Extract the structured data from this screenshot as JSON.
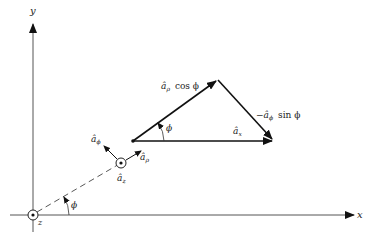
{
  "figure": {
    "type": "vector-decomposition-diagram",
    "axes": {
      "x_label": "x",
      "y_label": "y",
      "z_label": "z",
      "origin_symbol": "dot-in-circle (z-axis out of page)"
    },
    "angle_label": "ϕ",
    "point": {
      "unit_vectors": {
        "a_rho": "âρ",
        "a_phi": "âϕ",
        "a_z": "âz"
      }
    },
    "triangle": {
      "side_rho": "âρ cos ϕ",
      "side_phi": "−âϕ sin ϕ",
      "side_x": "âx",
      "angle": "ϕ"
    },
    "colors": {
      "line": "#111111",
      "axis": "#555555",
      "text": "#222222"
    }
  },
  "labels": {
    "x": "x",
    "y": "y",
    "z": "z",
    "phi": "ϕ",
    "a_hat": "â",
    "rho_sub": "ρ",
    "phi_sub": "ϕ",
    "z_sub": "z",
    "x_sub": "x",
    "cos_phi": "cos ϕ",
    "sin_phi": "sin ϕ",
    "minus": "−"
  }
}
